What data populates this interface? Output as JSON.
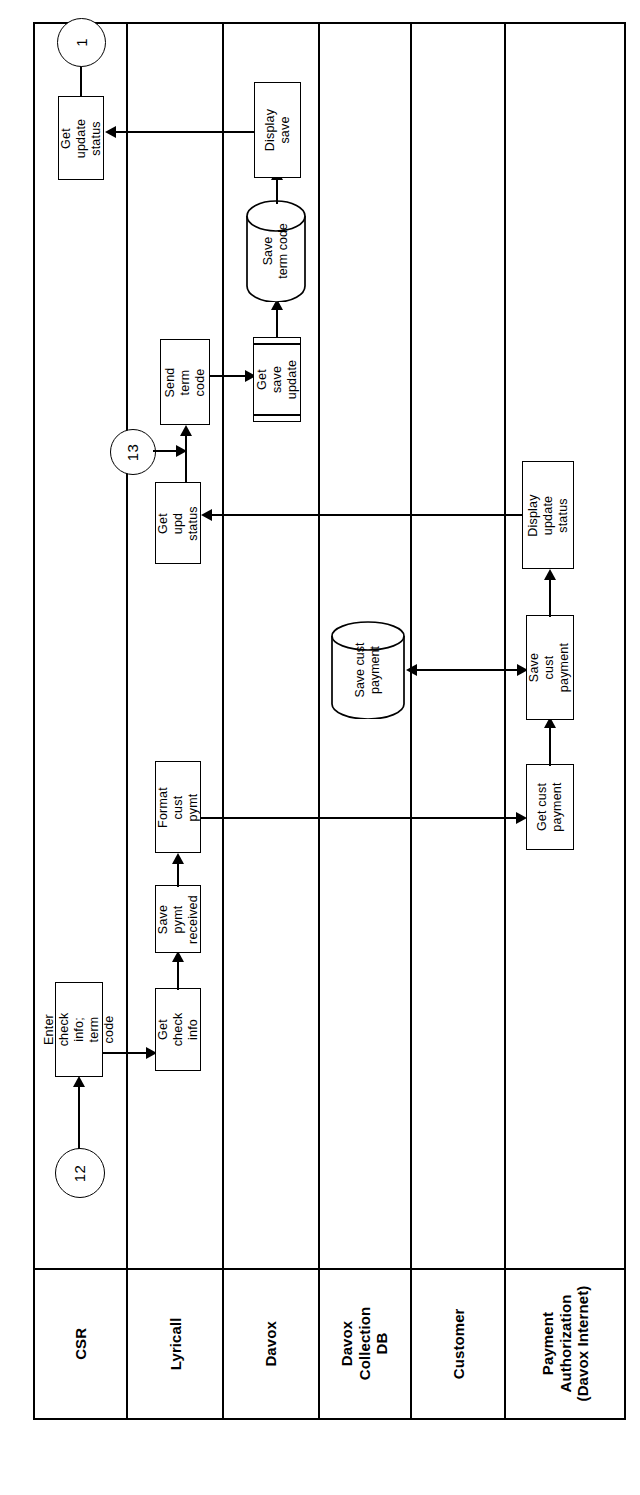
{
  "diagram": {
    "orientation": "rotated-90",
    "lanes": [
      {
        "id": "csr",
        "label": "CSR"
      },
      {
        "id": "lyricall",
        "label": "Lyricall"
      },
      {
        "id": "davox",
        "label": "Davox"
      },
      {
        "id": "davoxdb",
        "label": "Davox\nCollection DB"
      },
      {
        "id": "customer",
        "label": "Customer"
      },
      {
        "id": "payauth",
        "label": "Payment\nAuthorization\n(Davox Internet)"
      }
    ],
    "connectors": [
      {
        "id": "c12",
        "label": "12",
        "lane": "csr"
      },
      {
        "id": "c1",
        "label": "1",
        "lane": "csr"
      },
      {
        "id": "c13",
        "label": "13",
        "lane": "lyricall"
      }
    ],
    "nodes": [
      {
        "id": "enter_check",
        "label": "Enter check info;\nterm code",
        "lane": "csr",
        "shape": "process"
      },
      {
        "id": "get_update",
        "label": "Get update\nstatus",
        "lane": "csr",
        "shape": "process"
      },
      {
        "id": "get_check",
        "label": "Get check\ninfo",
        "lane": "lyricall",
        "shape": "process"
      },
      {
        "id": "save_pymt",
        "label": "Save pymt\nreceived",
        "lane": "lyricall",
        "shape": "process"
      },
      {
        "id": "format_cust",
        "label": "Format cust\npymt",
        "lane": "lyricall",
        "shape": "process"
      },
      {
        "id": "get_upd",
        "label": "Get upd\nstatus",
        "lane": "lyricall",
        "shape": "process"
      },
      {
        "id": "send_term",
        "label": "Send  term\ncode",
        "lane": "lyricall",
        "shape": "process"
      },
      {
        "id": "get_save_upd",
        "label": "Get save\nupdate",
        "lane": "davox",
        "shape": "predefined"
      },
      {
        "id": "display_save",
        "label": "Display save",
        "lane": "davox",
        "shape": "process"
      },
      {
        "id": "save_term_db",
        "label": "Save\nterm code",
        "lane": "davox",
        "shape": "database"
      },
      {
        "id": "save_cust_db",
        "label": "Save cust\npayment",
        "lane": "davoxdb",
        "shape": "database"
      },
      {
        "id": "get_cust_pay",
        "label": "Get cust\npayment",
        "lane": "payauth",
        "shape": "process"
      },
      {
        "id": "save_cust_pay",
        "label": "Save cust\npayment",
        "lane": "payauth",
        "shape": "process"
      },
      {
        "id": "display_upd",
        "label": "Display update\nstatus",
        "lane": "payauth",
        "shape": "process"
      }
    ]
  }
}
